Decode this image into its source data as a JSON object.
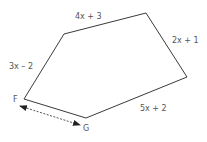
{
  "diagram": {
    "type": "pentagon",
    "colors": {
      "stroke": "#3a3a3a",
      "label": "#555555",
      "arrow": "#222222"
    },
    "vertices": [
      {
        "name": "F",
        "x": 24,
        "y": 99
      },
      {
        "name": "G",
        "x": 86,
        "y": 118
      },
      {
        "name": "",
        "x": 187,
        "y": 77
      },
      {
        "name": "",
        "x": 146,
        "y": 13
      },
      {
        "name": "",
        "x": 64,
        "y": 34
      }
    ],
    "vertex_labels": {
      "F": "F",
      "G": "G"
    },
    "side_labels": {
      "top": "4x + 3",
      "right_upper": "2x + 1",
      "left": "3x – 2",
      "bottom_right": "5x + 2"
    },
    "dashed_arrow": {
      "from": "near F",
      "to": "near G",
      "style": "dashed double-headed"
    }
  }
}
